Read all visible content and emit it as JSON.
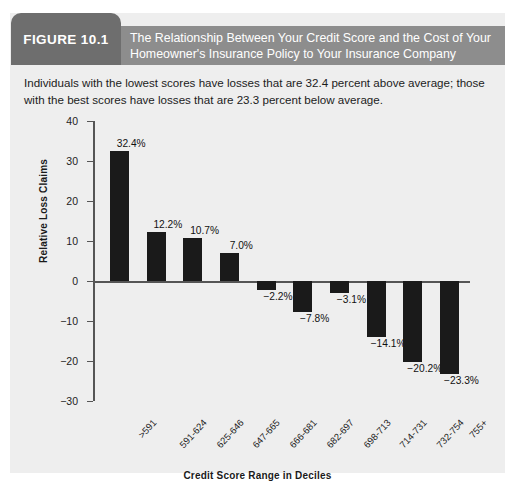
{
  "figure": {
    "number_label": "FIGURE 10.1",
    "title": "The Relationship Between Your Credit Score and the Cost of Your Homeowner's Insurance Policy to Your Insurance Company",
    "description": "Individuals with the lowest scores have losses that are 32.4 percent above average; those with the best scores have losses that are 23.3 percent below average.",
    "colors": {
      "number_box": "#6e6e6e",
      "title_band": "#8d8d8d",
      "panel_background": "#eeeeee",
      "bar": "#1a1a1a",
      "axis": "#555555"
    }
  },
  "chart_data": {
    "type": "bar",
    "title": "",
    "xlabel": "Credit Score Range in Deciles",
    "ylabel": "Relative Loss Claims",
    "categories": [
      ">591",
      "591-624",
      "625-646",
      "647-665",
      "666-681",
      "682-697",
      "698-713",
      "714-731",
      "732-754",
      "755+"
    ],
    "values": [
      32.4,
      12.2,
      10.7,
      7.0,
      -2.2,
      -7.8,
      -3.1,
      -14.1,
      -20.2,
      -23.3
    ],
    "data_labels": [
      "32.4%",
      "12.2%",
      "10.7%",
      "7.0%",
      "−2.2%",
      "−7.8%",
      "−3.1%",
      "−14.1%",
      "−20.2%",
      "−23.3%"
    ],
    "ylim": [
      -30,
      40
    ],
    "yticks": [
      40,
      30,
      20,
      10,
      0,
      -10,
      -20,
      -30
    ],
    "ytick_labels": [
      "40",
      "30",
      "20",
      "10",
      "0",
      "−10",
      "−20",
      "−30"
    ],
    "grid": false,
    "legend": null
  }
}
